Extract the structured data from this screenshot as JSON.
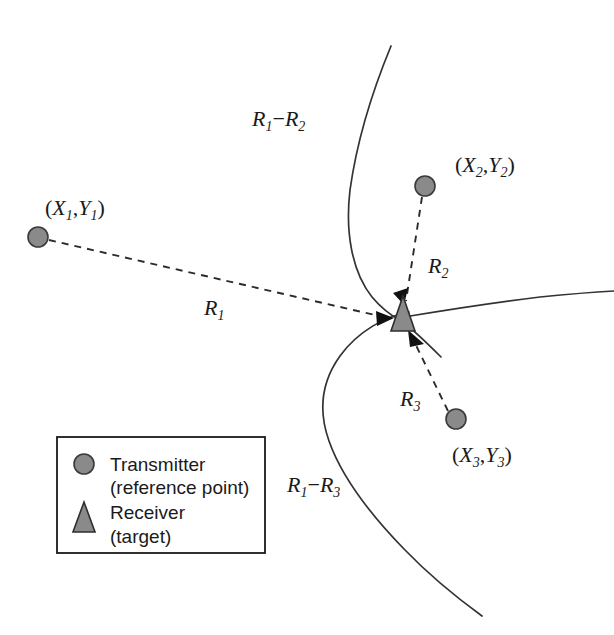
{
  "figure": {
    "background_color": "#ffffff",
    "marker_fill_color": "#8a8a8a",
    "marker_stroke_color": "#3a3a3a",
    "curve_color": "#333333",
    "arrow_color": "#111111"
  },
  "transmitters": [
    {
      "id": "tx1",
      "label_open": "(",
      "label_x": "X",
      "label_x_sub": "1",
      "label_comma": ",",
      "label_y": "Y",
      "label_y_sub": "1",
      "label_close": ")",
      "label_text": "(X1,Y1)",
      "cx": 38,
      "cy": 237,
      "r": 10
    },
    {
      "id": "tx2",
      "label_open": "(",
      "label_x": "X",
      "label_x_sub": "2",
      "label_comma": ",",
      "label_y": "Y",
      "label_y_sub": "2",
      "label_close": ")",
      "label_text": "(X2,Y2)",
      "cx": 425,
      "cy": 186,
      "r": 10
    },
    {
      "id": "tx3",
      "label_open": "(",
      "label_x": "X",
      "label_x_sub": "3",
      "label_comma": ",",
      "label_y": "Y",
      "label_y_sub": "3",
      "label_close": ")",
      "label_text": "(X3,Y3)",
      "cx": 456,
      "cy": 419,
      "r": 10
    }
  ],
  "receiver": {
    "id": "rx",
    "name": "receiver-target",
    "cx": 403,
    "cy": 318
  },
  "range_labels": [
    {
      "id": "r1",
      "base": "R",
      "sub": "1",
      "text": "R1",
      "x": 204,
      "y": 315
    },
    {
      "id": "r2",
      "base": "R",
      "sub": "2",
      "text": "R2",
      "x": 428,
      "y": 273
    },
    {
      "id": "r3",
      "base": "R",
      "sub": "3",
      "text": "R3",
      "x": 400,
      "y": 406
    }
  ],
  "hyperbola_labels": [
    {
      "id": "r1-minus-r2",
      "base1": "R",
      "sub1": "1",
      "operator": "−",
      "base2": "R",
      "sub2": "2",
      "text": "R1−R2",
      "x": 252,
      "y": 126
    },
    {
      "id": "r1-minus-r3",
      "base1": "R",
      "sub1": "1",
      "operator": "−",
      "base2": "R",
      "sub2": "3",
      "text": "R1−R3",
      "x": 287,
      "y": 492
    }
  ],
  "legend": {
    "box": {
      "x": 57,
      "y": 437,
      "width": 208,
      "height": 116
    },
    "entries": [
      {
        "marker": "circle",
        "marker_name": "legend-transmitter-marker",
        "line1": "Transmitter",
        "line2": "(reference point)"
      },
      {
        "marker": "triangle",
        "marker_name": "legend-receiver-marker",
        "line1": "Receiver",
        "line2": "(target)"
      }
    ]
  }
}
